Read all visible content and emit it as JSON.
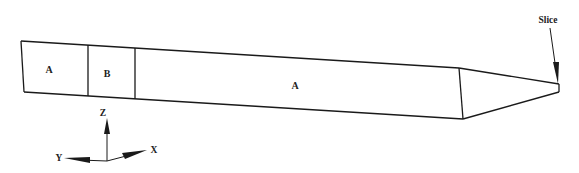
{
  "diagram": {
    "type": "schematic",
    "stroke_color": "#1a1a1a",
    "background": "#ffffff",
    "regions": [
      {
        "id": "region-1",
        "label": "A"
      },
      {
        "id": "region-2",
        "label": "B"
      },
      {
        "id": "region-3",
        "label": "A"
      }
    ],
    "annotation": {
      "label": "Slice"
    },
    "axes": {
      "z": "Z",
      "y": "Y",
      "x": "X"
    }
  }
}
